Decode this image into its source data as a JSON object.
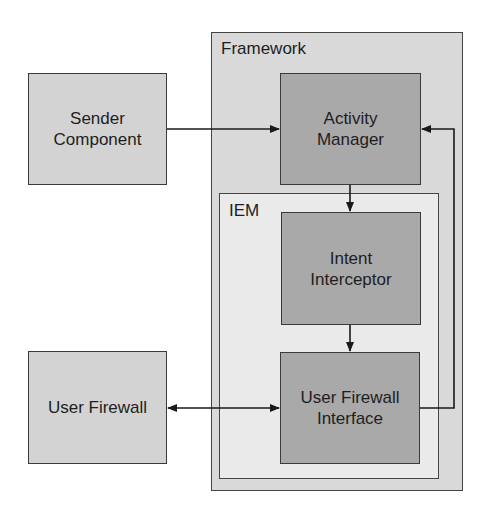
{
  "diagram": {
    "containers": {
      "framework": {
        "label": "Framework",
        "color": "#d9d9d9"
      },
      "iem": {
        "label": "IEM",
        "color": "#eaeaea"
      }
    },
    "nodes": {
      "sender": {
        "label_line1": "Sender",
        "label_line2": "Component",
        "color": "#d3d3d3"
      },
      "activity_manager": {
        "label_line1": "Activity",
        "label_line2": "Manager",
        "color": "#a9a9a9"
      },
      "intent_interceptor": {
        "label_line1": "Intent",
        "label_line2": "Interceptor",
        "color": "#a9a9a9"
      },
      "user_firewall_interface": {
        "label_line1": "User Firewall",
        "label_line2": "Interface",
        "color": "#a9a9a9"
      },
      "user_firewall": {
        "label": "User Firewall",
        "color": "#d3d3d3"
      }
    },
    "edges": [
      {
        "from": "Sender Component",
        "to": "Activity Manager",
        "type": "directed"
      },
      {
        "from": "Activity Manager",
        "to": "Intent Interceptor",
        "type": "directed"
      },
      {
        "from": "Intent Interceptor",
        "to": "User Firewall Interface",
        "type": "directed"
      },
      {
        "from": "User Firewall",
        "to": "User Firewall Interface",
        "type": "bidirectional"
      },
      {
        "from": "User Firewall Interface",
        "to": "Activity Manager",
        "type": "directed"
      }
    ]
  }
}
